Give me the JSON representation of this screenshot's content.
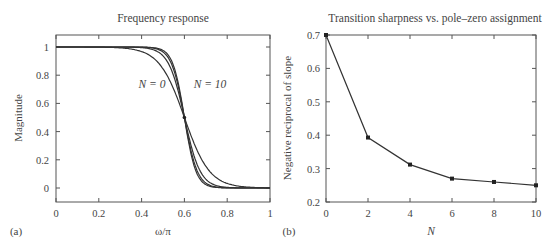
{
  "chart_data": [
    {
      "panel_label": "(a)",
      "type": "line",
      "title": "Frequency response",
      "xlabel": "ω/π",
      "ylabel": "Magnitude",
      "xlim": [
        0,
        1
      ],
      "ylim": [
        -0.1,
        1.08
      ],
      "xticks": [
        "0",
        "0.2",
        "0.4",
        "0.6",
        "0.8",
        "1"
      ],
      "yticks": [
        "0",
        "0.2",
        "0.4",
        "0.6",
        "0.8",
        "1"
      ],
      "grid": false,
      "annotations": [
        {
          "text": "N = 0",
          "x": 0.42,
          "y": 0.77
        },
        {
          "text": "N = 10",
          "x": 0.67,
          "y": 0.77
        }
      ],
      "marker_point": {
        "x": 0.6,
        "y": 0.5
      },
      "series": [
        {
          "name": "N=0",
          "steepness": 17,
          "x": [
            0,
            0.4,
            0.5,
            0.55,
            0.6,
            0.65,
            0.7,
            0.8,
            1
          ],
          "values": [
            1,
            0.97,
            0.85,
            0.7,
            0.5,
            0.3,
            0.13,
            0.0,
            0
          ]
        },
        {
          "name": "N=2",
          "steepness": 27,
          "x": [
            0,
            0.45,
            0.5,
            0.55,
            0.6,
            0.65,
            0.7,
            0.77,
            1
          ],
          "values": [
            1,
            0.99,
            0.96,
            0.82,
            0.5,
            0.18,
            0.05,
            0.0,
            0
          ]
        },
        {
          "name": "N=6",
          "steepness": 33,
          "x": [
            0,
            0.47,
            0.52,
            0.56,
            0.6,
            0.64,
            0.68,
            0.75,
            1
          ],
          "values": [
            1,
            1,
            0.97,
            0.85,
            0.5,
            0.15,
            0.03,
            0.0,
            0
          ]
        },
        {
          "name": "N=10",
          "steepness": 37,
          "x": [
            0,
            0.48,
            0.53,
            0.57,
            0.6,
            0.63,
            0.67,
            0.74,
            1
          ],
          "values": [
            1,
            1,
            0.98,
            0.85,
            0.5,
            0.15,
            0.02,
            0.0,
            0
          ]
        }
      ]
    },
    {
      "panel_label": "(b)",
      "type": "line",
      "title": "Transition sharpness vs. pole–zero assignment",
      "xlabel": "N",
      "ylabel": "Negative reciprocal of slope",
      "xlim": [
        0,
        10
      ],
      "ylim": [
        0.2,
        0.7
      ],
      "xticks": [
        "0",
        "2",
        "4",
        "6",
        "8",
        "10"
      ],
      "yticks": [
        "0.2",
        "0.3",
        "0.4",
        "0.5",
        "0.6",
        "0.7"
      ],
      "grid": false,
      "categories": [
        0,
        2,
        4,
        6,
        8,
        10
      ],
      "values": [
        0.7,
        0.393,
        0.312,
        0.27,
        0.26,
        0.25
      ]
    }
  ]
}
